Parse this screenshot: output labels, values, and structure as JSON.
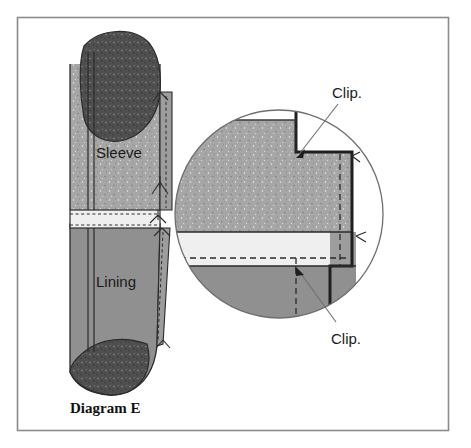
{
  "figure": {
    "caption": "Diagram E",
    "frame_color": "#8b8b8b",
    "background_color": "#ffffff"
  },
  "labels": {
    "sleeve": "Sleeve",
    "lining": "Lining",
    "clip_top": "Clip.",
    "clip_bottom": "Clip."
  },
  "colors": {
    "sleeve_fabric": "#a3a3a3",
    "sleeve_cap_dark": "#4f4f4f",
    "lining_fabric": "#909090",
    "facing_band": "#efefef",
    "outline": "#2b2b2b",
    "stitch_dash": "#2b2b2b",
    "leader_line": "#6f6f6f",
    "circle_outline": "#6f6f6f",
    "speckle": "#6e6e6e"
  },
  "geometry": {
    "frame": {
      "x": 17,
      "y": 17,
      "width": 431,
      "height": 413
    },
    "detail_circle": {
      "cx": 279,
      "cy": 214,
      "r": 104
    },
    "main_view": {
      "x": 60,
      "y": 25,
      "width": 120,
      "height": 365
    },
    "band_y": 210,
    "band_height": 18
  },
  "annotations": {
    "clip_top_leader": {
      "from_x": 330,
      "from_y": 102,
      "to_x": 295,
      "to_y": 155
    },
    "clip_bottom_leader": {
      "from_x": 330,
      "from_y": 325,
      "to_x": 294,
      "to_y": 272
    }
  }
}
